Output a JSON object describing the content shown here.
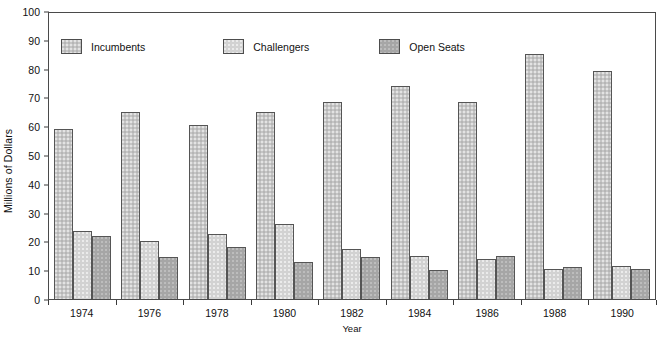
{
  "chart_data": {
    "type": "bar",
    "title": "",
    "subtitle": "",
    "xlabel": "Year",
    "ylabel": "Millions of Dollars",
    "categories": [
      "1974",
      "1976",
      "1978",
      "1980",
      "1982",
      "1984",
      "1986",
      "1988",
      "1990"
    ],
    "series": [
      {
        "name": "Incumbents",
        "color": "#c5c5c5",
        "values": [
          59,
          65,
          60.5,
          65,
          68.5,
          74,
          68.5,
          85,
          79
        ]
      },
      {
        "name": "Challengers",
        "color": "#d2d2d2",
        "values": [
          23.5,
          20,
          22.5,
          26,
          17.5,
          15,
          14,
          10.5,
          11.5
        ]
      },
      {
        "name": "Open Seats",
        "color": "#a6a6a6",
        "values": [
          22,
          14.5,
          18,
          13,
          14.5,
          10,
          15,
          11,
          10.5
        ]
      }
    ],
    "ylim": [
      0,
      100
    ],
    "y_ticks": [
      "0",
      "10",
      "20",
      "30",
      "40",
      "50",
      "60",
      "70",
      "80",
      "90",
      "100"
    ],
    "grid": false,
    "legend_position": "top-left",
    "frame": true
  },
  "axes": {
    "y_title": "Millions of Dollars",
    "x_title": "Year"
  },
  "legend": {
    "items": [
      {
        "label": "Incumbents",
        "swatch": "legend-swatch-incumbents"
      },
      {
        "label": "Challengers",
        "swatch": "legend-swatch-challengers"
      },
      {
        "label": "Open Seats",
        "swatch": "legend-swatch-open-seats"
      }
    ]
  }
}
